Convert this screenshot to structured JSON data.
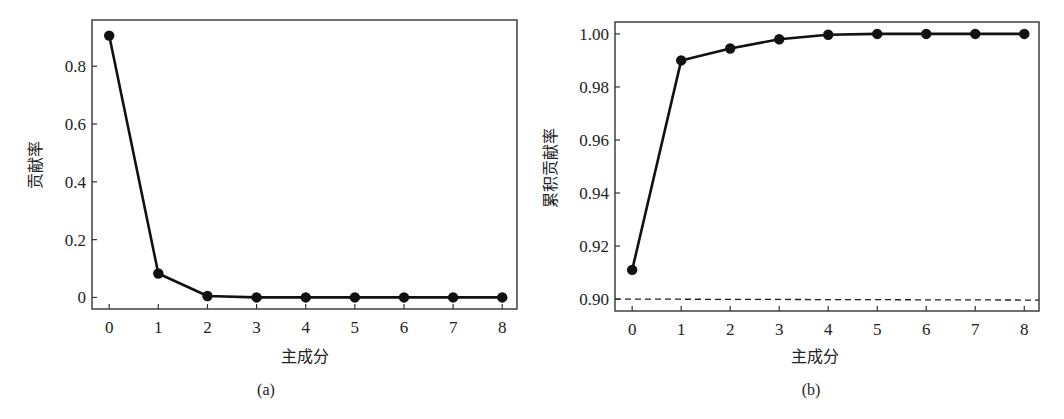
{
  "chart_data": [
    {
      "id": "a",
      "type": "line",
      "caption": "(a)",
      "title": "",
      "xlabel": "主成分",
      "ylabel": "贡献率",
      "x": [
        0,
        1,
        2,
        3,
        4,
        5,
        6,
        7,
        8
      ],
      "series": [
        {
          "name": "贡献率",
          "values": [
            0.906,
            0.083,
            0.005,
            0.0,
            0.0,
            0.0,
            0.0,
            0.0,
            0.0
          ],
          "marker": "filled-circle",
          "color": "#111111"
        }
      ],
      "xticks": [
        "0",
        "1",
        "2",
        "3",
        "4",
        "5",
        "6",
        "7",
        "8"
      ],
      "yticks": [
        "0",
        "0.2",
        "0.4",
        "0.6",
        "0.8"
      ],
      "xlim": [
        -0.35,
        8.3
      ],
      "ylim": [
        -0.04,
        0.96
      ],
      "grid": false,
      "legend": null
    },
    {
      "id": "b",
      "type": "line",
      "caption": "(b)",
      "title": "",
      "xlabel": "主成分",
      "ylabel": "累积贡献率",
      "x": [
        0,
        1,
        2,
        3,
        4,
        5,
        6,
        7,
        8
      ],
      "series": [
        {
          "name": "累积贡献率",
          "values": [
            0.911,
            0.99,
            0.9945,
            0.998,
            0.9997,
            1.0,
            1.0,
            1.0,
            1.0
          ],
          "marker": "filled-circle",
          "color": "#111111"
        }
      ],
      "reference_lines": [
        {
          "y": 0.9,
          "style": "dashed",
          "color": "#222222"
        }
      ],
      "xticks": [
        "0",
        "1",
        "2",
        "3",
        "4",
        "5",
        "6",
        "7",
        "8"
      ],
      "yticks": [
        "0.90",
        "0.92",
        "0.94",
        "0.96",
        "0.98",
        "1.00"
      ],
      "xlim": [
        -0.35,
        8.3
      ],
      "ylim": [
        0.8955,
        1.0045
      ],
      "grid": false,
      "legend": null
    }
  ]
}
